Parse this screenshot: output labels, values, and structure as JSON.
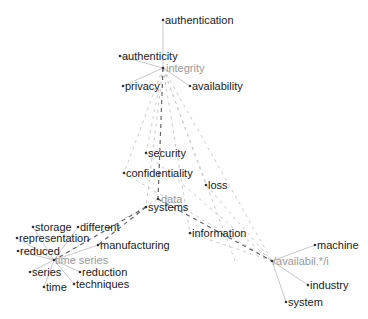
{
  "diagram": {
    "type": "term-network",
    "colors": {
      "term_text": "#1a1a1a",
      "hub_text": "#999999",
      "solid_edge": "#c8c8c8",
      "dashed_strong": "#666666",
      "dashed_weak": "#cccccc"
    },
    "hubs": [
      {
        "id": "integrity",
        "label": "integrity",
        "x": 163,
        "y": 68
      },
      {
        "id": "data",
        "label": "data",
        "x": 158,
        "y": 199
      },
      {
        "id": "time-series",
        "label": "time series",
        "x": 54,
        "y": 260
      },
      {
        "id": "availabil",
        "label": "/availabil.*/i",
        "x": 272,
        "y": 261
      }
    ],
    "terms": [
      {
        "id": "authentication",
        "label": "authentication",
        "x": 163,
        "y": 20
      },
      {
        "id": "authenticity",
        "label": "authenticity",
        "x": 120,
        "y": 56
      },
      {
        "id": "privacy",
        "label": "privacy",
        "x": 123,
        "y": 86
      },
      {
        "id": "availability",
        "label": "availability",
        "x": 190,
        "y": 86
      },
      {
        "id": "security",
        "label": "security",
        "x": 146,
        "y": 153
      },
      {
        "id": "confidentiality",
        "label": "confidentiality",
        "x": 124,
        "y": 173
      },
      {
        "id": "loss",
        "label": "loss",
        "x": 206,
        "y": 185
      },
      {
        "id": "systems",
        "label": "systems",
        "x": 146,
        "y": 207
      },
      {
        "id": "storage",
        "label": "storage",
        "x": 33,
        "y": 227
      },
      {
        "id": "different",
        "label": "different",
        "x": 78,
        "y": 227
      },
      {
        "id": "representation",
        "label": "representation",
        "x": 17,
        "y": 238
      },
      {
        "id": "reduced",
        "label": "reduced",
        "x": 18,
        "y": 251
      },
      {
        "id": "manufacturing",
        "label": "manufacturing",
        "x": 98,
        "y": 245
      },
      {
        "id": "series",
        "label": "series",
        "x": 30,
        "y": 272
      },
      {
        "id": "reduction",
        "label": "reduction",
        "x": 80,
        "y": 272
      },
      {
        "id": "time",
        "label": "time",
        "x": 44,
        "y": 287
      },
      {
        "id": "techniques",
        "label": "techniques",
        "x": 74,
        "y": 284
      },
      {
        "id": "information",
        "label": "information",
        "x": 190,
        "y": 233
      },
      {
        "id": "machine",
        "label": "machine",
        "x": 315,
        "y": 245
      },
      {
        "id": "industry",
        "label": "industry",
        "x": 308,
        "y": 285
      },
      {
        "id": "system",
        "label": "system",
        "x": 286,
        "y": 302
      }
    ]
  }
}
